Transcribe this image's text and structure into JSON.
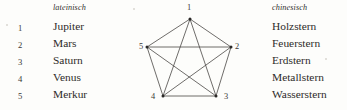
{
  "figure": {
    "name": "planet-names-and-pentagram-figure",
    "columns": {
      "index_header": "",
      "latin_header": "lateinisch",
      "chinese_header": "chinesisch"
    },
    "rows": [
      {
        "index": "1",
        "latin": "Jupiter",
        "chinese": "Holzstern"
      },
      {
        "index": "2",
        "latin": "Mars",
        "chinese": "Feuerstern"
      },
      {
        "index": "3",
        "latin": "Saturn",
        "chinese": "Erdstern"
      },
      {
        "index": "4",
        "latin": "Venus",
        "chinese": "Metallstern"
      },
      {
        "index": "5",
        "latin": "Merkur",
        "chinese": "Wasserstern"
      }
    ]
  },
  "diagram": {
    "name": "pentagram-complete-graph-k5",
    "vertex_labels": [
      "1",
      "2",
      "3",
      "4",
      "5"
    ],
    "vertices": [
      {
        "label": "1",
        "x": 54,
        "y": 19
      },
      {
        "label": "2",
        "x": 95,
        "y": 47
      },
      {
        "label": "3",
        "x": 80,
        "y": 96
      },
      {
        "label": "4",
        "x": 27,
        "y": 96
      },
      {
        "label": "5",
        "x": 11,
        "y": 47
      }
    ],
    "edges": [
      [
        "1",
        "2"
      ],
      [
        "2",
        "3"
      ],
      [
        "3",
        "4"
      ],
      [
        "4",
        "5"
      ],
      [
        "5",
        "1"
      ],
      [
        "1",
        "3"
      ],
      [
        "1",
        "4"
      ],
      [
        "2",
        "4"
      ],
      [
        "2",
        "5"
      ],
      [
        "3",
        "5"
      ]
    ],
    "line_color": "#4a4845",
    "vertex_color": "#2b2927",
    "line_width": 0.8
  },
  "colors": {
    "background": "#fdfdfb",
    "text": "#2e2c2a",
    "header_text": "#33312e",
    "rule": "#4a4845"
  }
}
